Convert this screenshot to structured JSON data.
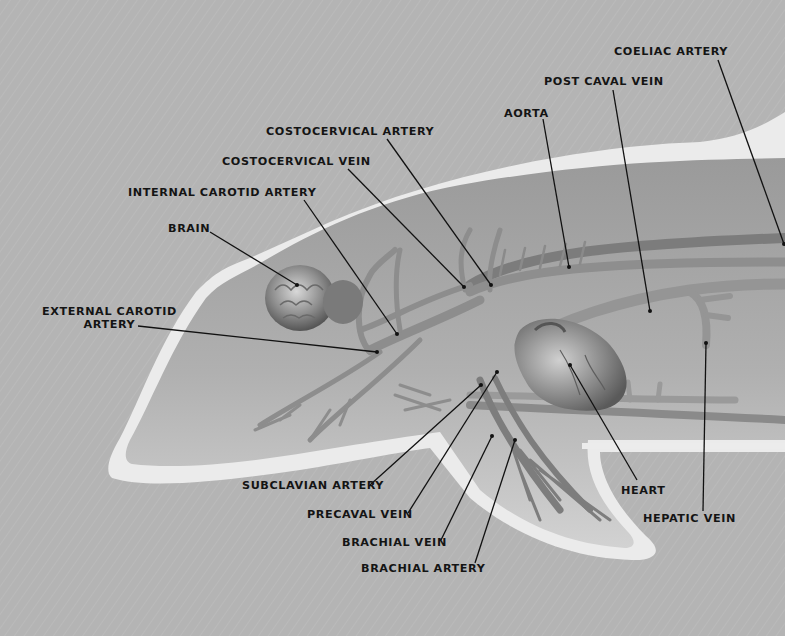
{
  "figure": {
    "colors": {
      "background": "#b4b4b4",
      "body_outline": "#ececec",
      "body_fill": "#a8a8a8",
      "vessel": "#8c8c8c",
      "vessel_dark": "#6e6e6e",
      "leader_line": "#111111",
      "label_text": "#141414"
    }
  },
  "labels": [
    {
      "id": "coeliac-artery",
      "text": "COELIAC ARTERY",
      "x": 614,
      "y": 45,
      "line": [
        718,
        60,
        784,
        244
      ]
    },
    {
      "id": "post-caval-vein",
      "text": "POST CAVAL VEIN",
      "x": 544,
      "y": 75,
      "line": [
        613,
        90,
        650,
        311
      ]
    },
    {
      "id": "aorta",
      "text": "AORTA",
      "x": 504,
      "y": 107,
      "line": [
        543,
        119,
        569,
        267
      ]
    },
    {
      "id": "costocervical-artery",
      "text": "COSTOCERVICAL ARTERY",
      "x": 266,
      "y": 125,
      "line": [
        387,
        139,
        491,
        285
      ]
    },
    {
      "id": "costocervical-vein",
      "text": "COSTOCERVICAL VEIN",
      "x": 222,
      "y": 155,
      "line": [
        348,
        169,
        464,
        287
      ]
    },
    {
      "id": "internal-carotid-artery",
      "text": "INTERNAL CAROTID ARTERY",
      "x": 128,
      "y": 186,
      "line": [
        304,
        200,
        397,
        334
      ]
    },
    {
      "id": "brain",
      "text": "BRAIN",
      "x": 168,
      "y": 222,
      "line": [
        210,
        232,
        297,
        285
      ]
    },
    {
      "id": "external-carotid-artery",
      "text": "EXTERNAL CAROTID",
      "text2": "ARTERY",
      "x": 42,
      "y": 305,
      "line": [
        138,
        326,
        377,
        352
      ]
    },
    {
      "id": "subclavian-artery",
      "text": "SUBCLAVIAN ARTERY",
      "x": 242,
      "y": 479,
      "line": [
        370,
        485,
        481,
        385
      ]
    },
    {
      "id": "precaval-vein",
      "text": "PRECAVAL VEIN",
      "x": 307,
      "y": 508,
      "line": [
        408,
        513,
        497,
        372
      ]
    },
    {
      "id": "brachial-vein",
      "text": "BRACHIAL VEIN",
      "x": 342,
      "y": 536,
      "line": [
        441,
        540,
        492,
        436
      ]
    },
    {
      "id": "brachial-artery",
      "text": "BRACHIAL ARTERY",
      "x": 361,
      "y": 562,
      "line": [
        475,
        563,
        515,
        440
      ]
    },
    {
      "id": "heart",
      "text": "HEART",
      "x": 621,
      "y": 484,
      "line": [
        637,
        480,
        570,
        365
      ]
    },
    {
      "id": "hepatic-vein",
      "text": "HEPATIC VEIN",
      "x": 643,
      "y": 512,
      "line": [
        703,
        511,
        706,
        343
      ]
    }
  ]
}
